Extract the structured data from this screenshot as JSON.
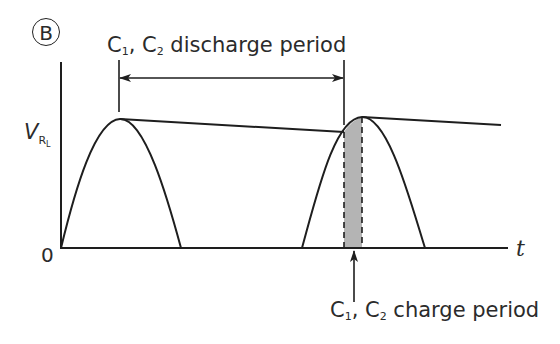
{
  "figure": {
    "panel_label": "B",
    "discharge_label": {
      "prefix": "C",
      "sub1": "1",
      "mid": ", C",
      "sub2": "2",
      "suffix": " discharge period"
    },
    "charge_label": {
      "prefix": "C",
      "sub1": "1",
      "mid": ", C",
      "sub2": "2",
      "suffix": " charge period"
    },
    "y_axis_label": {
      "main": "V",
      "sub": "R",
      "subsub": "L"
    },
    "x_axis_label": "t",
    "origin_label": "0",
    "colors": {
      "line": "#1e1e1e",
      "shade": "#b4b4b4",
      "text": "#2b2b2b"
    }
  }
}
